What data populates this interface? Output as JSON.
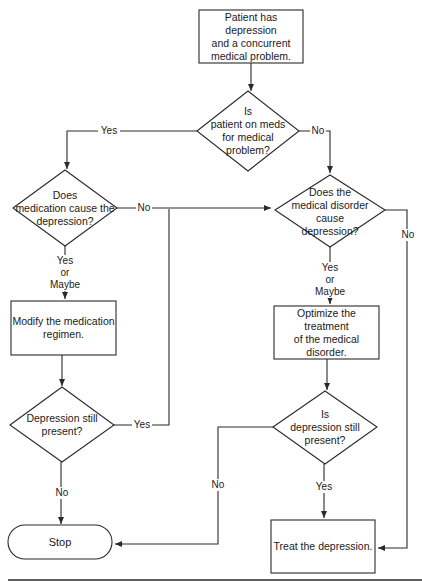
{
  "nodes": {
    "start": {
      "text": "Patient has depression\nand a concurrent\nmedical problem."
    },
    "on_meds": {
      "text": "Is\npatient on meds\nfor medical\nproblem?"
    },
    "med_cause": {
      "text": "Does\nmedication cause the\ndepression?"
    },
    "disorder_cause": {
      "text": "Does the\nmedical disorder\ncause\ndepression?"
    },
    "modify": {
      "text": "Modify the medication\nregimen."
    },
    "optimize": {
      "text": "Optimize the treatment\nof the medical disorder."
    },
    "still_present_left": {
      "text": "Depression still\npresent?"
    },
    "still_present_right": {
      "text": "Is\ndepression still\npresent?"
    },
    "stop": {
      "text": "Stop"
    },
    "treat": {
      "text": "Treat the depression."
    }
  },
  "edge_labels": {
    "on_meds_yes": "Yes",
    "on_meds_no": "No",
    "med_cause_no": "No",
    "med_cause_yes": "Yes\nor\nMaybe",
    "disorder_cause_yes": "Yes\nor\nMaybe",
    "disorder_cause_no": "No",
    "left_still_yes": "Yes",
    "left_still_no": "No",
    "right_still_no": "No",
    "right_still_yes": "Yes"
  },
  "colors": {
    "line": "#2a2a2a",
    "background": "#ffffff"
  }
}
